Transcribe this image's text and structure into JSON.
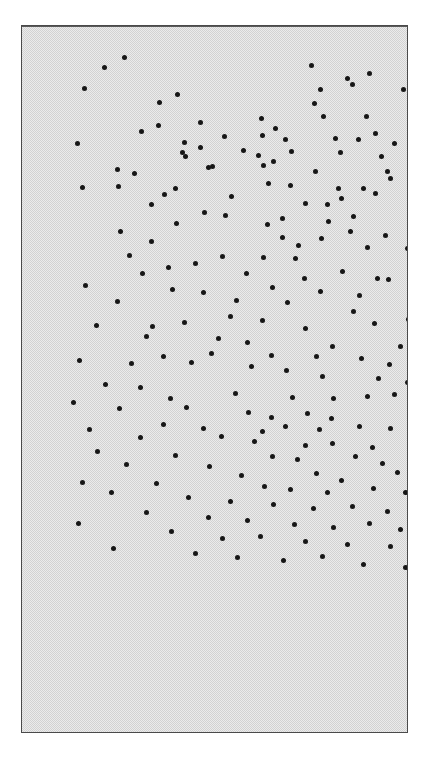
{
  "figure": {
    "type": "point-pattern-plot",
    "caption": "",
    "frame": {
      "x": 21,
      "y": 25,
      "width": 387,
      "height": 708,
      "border_color": "#4a4a4a",
      "background_color": "#d2d2d2"
    },
    "point_style": {
      "color": "#161616",
      "diameter_px": 5,
      "shape": "circle"
    }
  },
  "chart_data": {
    "type": "scatter",
    "title": "",
    "subtitle": "",
    "xlabel": "",
    "ylabel": "",
    "xlim": [
      0,
      387
    ],
    "ylim": [
      0,
      708
    ],
    "grid": false,
    "legend": null,
    "axis_ticks": [],
    "n_points": 197,
    "series": [
      {
        "name": "points",
        "marker": "filled-circle",
        "color": "#161616",
        "points": [
          [
            82,
            41
          ],
          [
            102,
            31
          ],
          [
            289,
            39
          ],
          [
            347,
            47
          ],
          [
            62,
            62
          ],
          [
            155,
            68
          ],
          [
            325,
            52
          ],
          [
            330,
            58
          ],
          [
            298,
            63
          ],
          [
            381,
            63
          ],
          [
            137,
            76
          ],
          [
            253,
            102
          ],
          [
            292,
            77
          ],
          [
            136,
            99
          ],
          [
            178,
            96
          ],
          [
            119,
            105
          ],
          [
            202,
            110
          ],
          [
            239,
            92
          ],
          [
            301,
            90
          ],
          [
            344,
            90
          ],
          [
            396,
            90
          ],
          [
            178,
            121
          ],
          [
            221,
            124
          ],
          [
            240,
            109
          ],
          [
            353,
            107
          ],
          [
            55,
            117
          ],
          [
            162,
            116
          ],
          [
            160,
            126
          ],
          [
            163,
            130
          ],
          [
            263,
            113
          ],
          [
            269,
            125
          ],
          [
            313,
            112
          ],
          [
            318,
            126
          ],
          [
            336,
            113
          ],
          [
            359,
            130
          ],
          [
            372,
            117
          ],
          [
            236,
            129
          ],
          [
            251,
            135
          ],
          [
            190,
            140
          ],
          [
            241,
            139
          ],
          [
            293,
            145
          ],
          [
            365,
            145
          ],
          [
            368,
            152
          ],
          [
            95,
            143
          ],
          [
            112,
            147
          ],
          [
            186,
            141
          ],
          [
            153,
            162
          ],
          [
            96,
            160
          ],
          [
            246,
            157
          ],
          [
            268,
            159
          ],
          [
            316,
            162
          ],
          [
            341,
            162
          ],
          [
            142,
            168
          ],
          [
            209,
            170
          ],
          [
            319,
            172
          ],
          [
            353,
            167
          ],
          [
            60,
            161
          ],
          [
            129,
            178
          ],
          [
            283,
            177
          ],
          [
            305,
            178
          ],
          [
            182,
            186
          ],
          [
            203,
            189
          ],
          [
            260,
            192
          ],
          [
            306,
            195
          ],
          [
            331,
            190
          ],
          [
            388,
            194
          ],
          [
            398,
            186
          ],
          [
            154,
            197
          ],
          [
            245,
            198
          ],
          [
            98,
            205
          ],
          [
            129,
            215
          ],
          [
            260,
            211
          ],
          [
            328,
            205
          ],
          [
            363,
            209
          ],
          [
            276,
            219
          ],
          [
            299,
            212
          ],
          [
            345,
            221
          ],
          [
            385,
            222
          ],
          [
            107,
            229
          ],
          [
            200,
            230
          ],
          [
            241,
            231
          ],
          [
            273,
            232
          ],
          [
            146,
            241
          ],
          [
            173,
            237
          ],
          [
            224,
            247
          ],
          [
            282,
            252
          ],
          [
            320,
            245
          ],
          [
            355,
            252
          ],
          [
            366,
            253
          ],
          [
            389,
            249
          ],
          [
            120,
            247
          ],
          [
            63,
            259
          ],
          [
            150,
            263
          ],
          [
            250,
            261
          ],
          [
            298,
            265
          ],
          [
            337,
            269
          ],
          [
            181,
            266
          ],
          [
            214,
            274
          ],
          [
            265,
            276
          ],
          [
            95,
            275
          ],
          [
            208,
            290
          ],
          [
            331,
            285
          ],
          [
            130,
            300
          ],
          [
            162,
            296
          ],
          [
            240,
            294
          ],
          [
            283,
            302
          ],
          [
            352,
            297
          ],
          [
            386,
            293
          ],
          [
            74,
            299
          ],
          [
            124,
            310
          ],
          [
            196,
            312
          ],
          [
            225,
            316
          ],
          [
            310,
            320
          ],
          [
            378,
            320
          ],
          [
            387,
            320
          ],
          [
            141,
            330
          ],
          [
            189,
            327
          ],
          [
            249,
            329
          ],
          [
            294,
            330
          ],
          [
            339,
            332
          ],
          [
            367,
            338
          ],
          [
            390,
            340
          ],
          [
            57,
            334
          ],
          [
            109,
            337
          ],
          [
            169,
            336
          ],
          [
            229,
            340
          ],
          [
            264,
            344
          ],
          [
            300,
            350
          ],
          [
            356,
            352
          ],
          [
            385,
            356
          ],
          [
            83,
            358
          ],
          [
            118,
            361
          ],
          [
            148,
            372
          ],
          [
            213,
            367
          ],
          [
            270,
            371
          ],
          [
            311,
            372
          ],
          [
            345,
            370
          ],
          [
            372,
            368
          ],
          [
            51,
            376
          ],
          [
            97,
            382
          ],
          [
            164,
            381
          ],
          [
            226,
            386
          ],
          [
            249,
            391
          ],
          [
            285,
            387
          ],
          [
            309,
            392
          ],
          [
            67,
            403
          ],
          [
            141,
            398
          ],
          [
            181,
            402
          ],
          [
            240,
            405
          ],
          [
            263,
            400
          ],
          [
            297,
            403
          ],
          [
            337,
            400
          ],
          [
            368,
            402
          ],
          [
            118,
            411
          ],
          [
            199,
            410
          ],
          [
            232,
            415
          ],
          [
            283,
            419
          ],
          [
            310,
            417
          ],
          [
            350,
            421
          ],
          [
            391,
            423
          ],
          [
            75,
            425
          ],
          [
            153,
            429
          ],
          [
            250,
            430
          ],
          [
            275,
            433
          ],
          [
            333,
            430
          ],
          [
            360,
            437
          ],
          [
            104,
            438
          ],
          [
            187,
            440
          ],
          [
            219,
            449
          ],
          [
            294,
            447
          ],
          [
            319,
            454
          ],
          [
            375,
            446
          ],
          [
            398,
            449
          ],
          [
            60,
            456
          ],
          [
            134,
            457
          ],
          [
            242,
            460
          ],
          [
            268,
            463
          ],
          [
            305,
            466
          ],
          [
            351,
            462
          ],
          [
            383,
            466
          ],
          [
            89,
            466
          ],
          [
            166,
            471
          ],
          [
            208,
            475
          ],
          [
            251,
            478
          ],
          [
            291,
            482
          ],
          [
            330,
            480
          ],
          [
            365,
            485
          ],
          [
            396,
            490
          ],
          [
            124,
            486
          ],
          [
            186,
            491
          ],
          [
            225,
            494
          ],
          [
            272,
            498
          ],
          [
            311,
            501
          ],
          [
            347,
            497
          ],
          [
            378,
            503
          ],
          [
            56,
            497
          ],
          [
            149,
            505
          ],
          [
            200,
            512
          ],
          [
            238,
            510
          ],
          [
            283,
            515
          ],
          [
            325,
            518
          ],
          [
            368,
            520
          ],
          [
            392,
            515
          ],
          [
            91,
            522
          ],
          [
            173,
            527
          ],
          [
            215,
            531
          ],
          [
            261,
            534
          ],
          [
            300,
            530
          ],
          [
            341,
            538
          ],
          [
            383,
            541
          ]
        ]
      }
    ]
  }
}
